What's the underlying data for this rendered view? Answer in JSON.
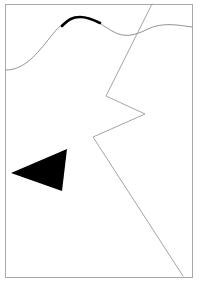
{
  "figure": {
    "canvas": {
      "width": 200,
      "height": 284,
      "background": "#ffffff"
    },
    "frame": {
      "name": "border-frame",
      "x": 5,
      "y": 4,
      "width": 187,
      "height": 273,
      "stroke": "#a8a8a8",
      "stroke_width": 1,
      "fill": "none"
    },
    "shapes": {
      "wave_curve": {
        "label": "wavy curve",
        "stroke": "#777777",
        "stroke_width": 0.8,
        "path": "M 6,70 C 22,70 34,58 48,40 C 58,27 66,18 80,17 C 92,16 100,24 112,31 C 124,38 134,36 148,29 C 162,22 178,25 192,27"
      },
      "wave_curve_thick": {
        "label": "thickened crest of wave curve",
        "stroke": "#000000",
        "stroke_width": 2.6,
        "path": "M 62,26 C 68,20 72,17 80,17 C 88,17 94,20 100,23"
      },
      "zigzag_polyline": {
        "label": "zigzag polyline",
        "stroke": "#9a9a9a",
        "stroke_width": 0.9,
        "points": "152,4 106,96 145,114 93,137 183,276"
      },
      "black_triangle": {
        "label": "solid black triangle",
        "fill": "#000000",
        "points": "11,173 67,149 62,191"
      }
    }
  }
}
